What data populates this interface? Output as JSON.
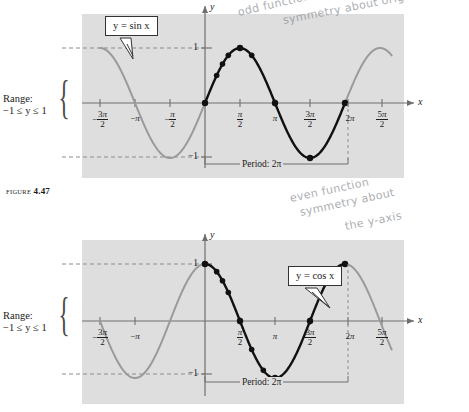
{
  "figure": {
    "caption_word": "FIGURE",
    "caption_number": "4.47"
  },
  "annotations": {
    "top_handwriting_line1": "odd function",
    "top_handwriting_line2": "symmetry about orig",
    "bottom_handwriting_line1": "even function",
    "bottom_handwriting_line2": "symmetry about",
    "bottom_handwriting_line3": "the y-axis"
  },
  "panels": [
    {
      "id": "sine-panel",
      "callout_label": "y = sin x",
      "range_label_line1": "Range:",
      "range_label_line2": "−1 ≤ y ≤ 1",
      "period_label": "Period: 2π",
      "y_axis_name": "y",
      "x_axis_name": "x",
      "y_top_value": "1",
      "y_bottom_value": "−1",
      "x_ticks": [
        {
          "label": "-3pi/2",
          "num": "3π",
          "den": "2",
          "sign": "−",
          "x": 100
        },
        {
          "label": "-pi",
          "whole": "−π",
          "x": 135
        },
        {
          "label": "-pi/2",
          "num": "π",
          "den": "2",
          "sign": "−",
          "x": 170
        },
        {
          "label": "pi/2",
          "num": "π",
          "den": "2",
          "sign": "",
          "x": 240
        },
        {
          "label": "pi",
          "whole": "π",
          "x": 275
        },
        {
          "label": "3pi/2",
          "num": "3π",
          "den": "2",
          "sign": "",
          "x": 310
        },
        {
          "label": "2pi",
          "whole": "2π",
          "x": 348
        },
        {
          "label": "5pi/2",
          "num": "5π",
          "den": "2",
          "sign": "",
          "x": 382
        }
      ]
    },
    {
      "id": "cosine-panel",
      "callout_label": "y = cos x",
      "range_label_line1": "Range:",
      "range_label_line2": "−1 ≤ y ≤ 1",
      "period_label": "Period: 2π",
      "y_axis_name": "y",
      "x_axis_name": "x",
      "y_top_value": "1",
      "y_bottom_value": "−1",
      "x_ticks": [
        {
          "label": "-3pi/2",
          "num": "3π",
          "den": "2",
          "sign": "−",
          "x": 100
        },
        {
          "label": "-pi",
          "whole": "−π",
          "x": 135
        },
        {
          "label": "pi/2",
          "num": "π",
          "den": "2",
          "sign": "",
          "x": 240
        },
        {
          "label": "pi",
          "whole": "π",
          "x": 275
        },
        {
          "label": "3pi/2",
          "num": "3π",
          "den": "2",
          "sign": "",
          "x": 310
        },
        {
          "label": "2pi",
          "whole": "2π",
          "x": 348
        },
        {
          "label": "5pi/2",
          "num": "5π",
          "den": "2",
          "sign": "",
          "x": 382
        }
      ]
    }
  ],
  "colors": {
    "plot_background": "#dedede",
    "page_background": "#ffffff",
    "highlight_curve": "#111111",
    "faded_curve": "#9a9a9a",
    "axis": "#6e6e6e",
    "dashed": "#8c8c8c",
    "handwriting": "#8b8f96"
  },
  "chart_data": [
    {
      "type": "line",
      "title": "y = sin x",
      "xlabel": "x",
      "ylabel": "y",
      "function": "sin",
      "xlim": [
        -4.71238898038469,
        8.377580409572783
      ],
      "ylim": [
        -1.35,
        1.35
      ],
      "grid": false,
      "legend": "callout",
      "highlight_domain": [
        0,
        6.283185307179586
      ],
      "annotations": [
        "Range: −1 ≤ y ≤ 1",
        "Period: 2π"
      ],
      "xtick_values": [
        -4.71238898,
        -3.14159265,
        -1.57079633,
        1.57079633,
        3.14159265,
        4.71238898,
        6.28318531,
        7.85398163
      ],
      "xtick_labels": [
        "−3π/2",
        "−π",
        "−π/2",
        "π/2",
        "π",
        "3π/2",
        "2π",
        "5π/2"
      ],
      "ytick_values": [
        -1,
        1
      ],
      "ytick_labels": [
        "−1",
        "1"
      ],
      "marked_points": [
        {
          "x": 0.0,
          "y": 0.0
        },
        {
          "x": 0.523598776,
          "y": 0.5
        },
        {
          "x": 0.785398163,
          "y": 0.707106781
        },
        {
          "x": 1.047197551,
          "y": 0.866025404
        },
        {
          "x": 1.570796327,
          "y": 1.0
        },
        {
          "x": 2.094395102,
          "y": 0.866025404
        },
        {
          "x": 3.141592654,
          "y": 0.0
        },
        {
          "x": 4.71238898,
          "y": -1.0
        },
        {
          "x": 6.283185307,
          "y": 0.0
        }
      ]
    },
    {
      "type": "line",
      "title": "y = cos x",
      "xlabel": "x",
      "ylabel": "y",
      "function": "cos",
      "xlim": [
        -4.71238898038469,
        8.377580409572783
      ],
      "ylim": [
        -1.35,
        1.35
      ],
      "grid": false,
      "legend": "callout",
      "highlight_domain": [
        0,
        6.283185307179586
      ],
      "annotations": [
        "Range: −1 ≤ y ≤ 1",
        "Period: 2π"
      ],
      "xtick_values": [
        -4.71238898,
        -3.14159265,
        1.57079633,
        3.14159265,
        4.71238898,
        6.28318531,
        7.85398163
      ],
      "xtick_labels": [
        "−3π/2",
        "−π",
        "π/2",
        "π",
        "3π/2",
        "2π",
        "5π/2"
      ],
      "ytick_values": [
        -1,
        1
      ],
      "ytick_labels": [
        "−1",
        "1"
      ],
      "marked_points": [
        {
          "x": 0.0,
          "y": 1.0
        },
        {
          "x": 0.523598776,
          "y": 0.866025404
        },
        {
          "x": 0.785398163,
          "y": 0.707106781
        },
        {
          "x": 1.047197551,
          "y": 0.5
        },
        {
          "x": 1.570796327,
          "y": 0.0
        },
        {
          "x": 2.094395102,
          "y": -0.5
        },
        {
          "x": 2.617993878,
          "y": -0.866025404
        },
        {
          "x": 3.141592654,
          "y": -1.0
        },
        {
          "x": 4.71238898,
          "y": 0.0
        },
        {
          "x": 6.283185307,
          "y": 1.0
        }
      ]
    }
  ]
}
